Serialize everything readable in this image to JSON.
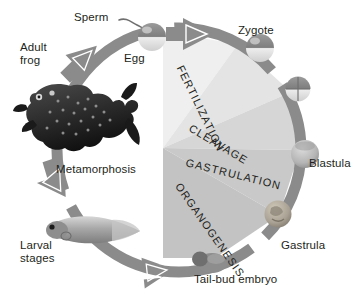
{
  "figure": {
    "ring_color": "#8b8b8b",
    "background_color": "#ffffff",
    "text_color": "#231f20"
  },
  "cycle_labels": {
    "adult_frog": "Adult\nfrog",
    "sperm": "Sperm",
    "egg": "Egg",
    "zygote": "Zygote",
    "blastula": "Blastula",
    "gastrula": "Gastrula",
    "tail_bud_embryo": "Tail-bud embryo",
    "larval_stages": "Larval\nstages",
    "metamorphosis": "Metamorphosis"
  },
  "wedge_labels": {
    "fertilization": "FERTILIZATION",
    "cleavage": "CLEAVAGE",
    "gastrulation": "GASTRULATION",
    "organogenesis": "ORGANOGENESIS"
  },
  "wedges": [
    {
      "name": "fertilization",
      "fill": "#efefef"
    },
    {
      "name": "cleavage",
      "fill": "#e2e2e2"
    },
    {
      "name": "gastrulation",
      "fill": "#d2d2d2"
    },
    {
      "name": "organogenesis",
      "fill": "#c4c4c4"
    }
  ],
  "specimens": {
    "egg": "egg-cell",
    "zygote": "zygote-cell",
    "cleavage_embryo": "cleavage-embryo",
    "blastula": "blastula-embryo",
    "gastrula": "gastrula-embryo",
    "tail_bud": "tail-bud-embryo",
    "tadpole": "tadpole-larva",
    "frog": "adult-frog"
  }
}
